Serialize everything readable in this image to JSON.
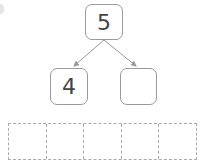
{
  "diagram": {
    "type": "number-bond",
    "whole": {
      "value": "5"
    },
    "parts": [
      {
        "value": "4"
      },
      {
        "value": ""
      }
    ],
    "ten_frame": {
      "cells": 5,
      "filled": 0,
      "style": "dashed"
    }
  },
  "colors": {
    "box_border": "#9a9a9a",
    "text": "#444444",
    "arrow": "#999999",
    "grid_border": "#aaaaaa"
  }
}
